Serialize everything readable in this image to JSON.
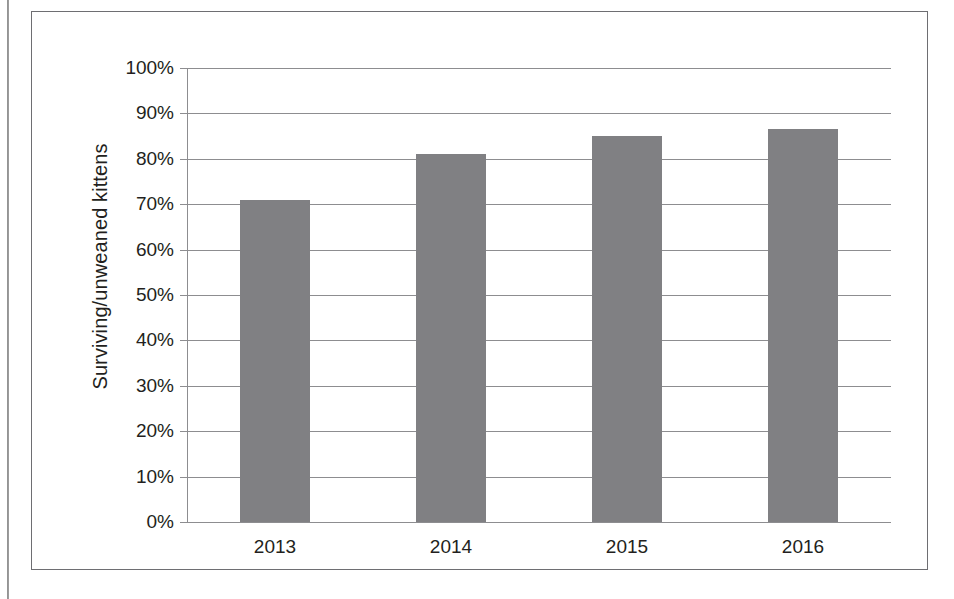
{
  "figure": {
    "background_color": "#ffffff",
    "frame_color": "#6e6e72",
    "bar_color": "#808083",
    "grid_color": "#8d8d90",
    "text_color": "#231f20"
  },
  "chart_data": {
    "type": "bar",
    "title": "",
    "subtitle": "",
    "xlabel": "",
    "ylabel": "Surviving/unweaned kittens",
    "categories": [
      "2013",
      "2014",
      "2015",
      "2016"
    ],
    "values": [
      71,
      81,
      85,
      86.5
    ],
    "value_labels": [
      "",
      "",
      "",
      ""
    ],
    "series": [
      {
        "name": "Surviving/unweaned kittens",
        "values": [
          71,
          81,
          85,
          86.5
        ]
      }
    ],
    "ylim": [
      0,
      100
    ],
    "ytick_values": [
      0,
      10,
      20,
      30,
      40,
      50,
      60,
      70,
      80,
      90,
      100
    ],
    "ytick_labels": [
      "0%",
      "10%",
      "20%",
      "30%",
      "40%",
      "50%",
      "60%",
      "70%",
      "80%",
      "90%",
      "100%"
    ],
    "grid": "horizontal",
    "legend": "none",
    "units": "percent",
    "annotations": []
  }
}
